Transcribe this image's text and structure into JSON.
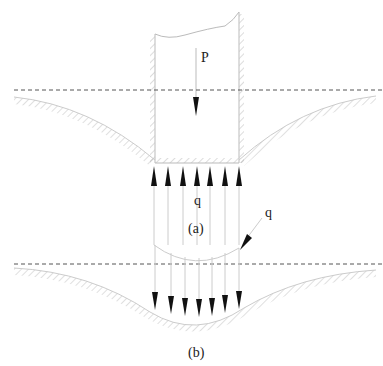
{
  "figure": {
    "panel_a": {
      "caption": "(a)",
      "load_label": "P",
      "pressure_label": "q",
      "description": "Rigid footing with applied load P; uniform upward contact pressure q at the footing base"
    },
    "panel_b": {
      "caption": "(b)",
      "pressure_label": "q",
      "description": "Flexible load with curved pressure distribution q acting downward on the settled ground surface"
    },
    "colors": {
      "line": "#bbbbbb",
      "hatch": "#c8c8c8",
      "arrow": "#111111",
      "dashed": "#555555"
    }
  }
}
